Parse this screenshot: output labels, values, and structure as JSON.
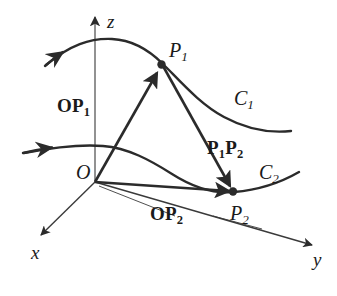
{
  "figure": {
    "background_color": "#ffffff",
    "stroke_color": "#2b2b2b",
    "text_color": "#1a1a1a"
  },
  "axes": [
    {
      "id": "z",
      "label": "z",
      "direction": "up",
      "tip": [
        95,
        14
      ],
      "origin": [
        95,
        182
      ]
    },
    {
      "id": "x",
      "label": "x",
      "direction": "down-left",
      "tip": [
        38,
        238
      ],
      "origin": [
        95,
        182
      ]
    },
    {
      "id": "y",
      "label": "y",
      "direction": "right-down",
      "tip": [
        316,
        246
      ],
      "origin": [
        95,
        182
      ]
    }
  ],
  "origin": {
    "label": "O",
    "point": [
      95,
      182
    ]
  },
  "points": [
    {
      "id": "P1",
      "label": "P",
      "subscript": "1",
      "coords": [
        161,
        64
      ]
    },
    {
      "id": "P2",
      "label": "P",
      "subscript": "2",
      "coords": [
        233,
        192
      ]
    }
  ],
  "curves": [
    {
      "id": "C1",
      "label": "C",
      "subscript": "1",
      "arrow": "start",
      "note": "upper space curve through P1"
    },
    {
      "id": "C2",
      "label": "C",
      "subscript": "2",
      "arrow": "start",
      "note": "lower space curve through P2"
    }
  ],
  "vectors": [
    {
      "id": "OP1",
      "label_bold": "OP",
      "subscript": "1",
      "from": "O",
      "to": "P1"
    },
    {
      "id": "OP2",
      "label_bold": "OP",
      "subscript": "2",
      "from": "O",
      "to": "P2"
    },
    {
      "id": "P1P2",
      "label_bold": "P",
      "subscript": "1",
      "label_bold2": "P",
      "subscript2": "2",
      "from": "P1",
      "to": "P2"
    }
  ],
  "labels": {
    "axis_z": "z",
    "axis_x": "x",
    "axis_y": "y",
    "origin": "O",
    "point_p1_base": "P",
    "point_p1_sub": "1",
    "point_p2_base": "P",
    "point_p2_sub": "2",
    "curve_c1_base": "C",
    "curve_c1_sub": "1",
    "curve_c2_base": "C",
    "curve_c2_sub": "2",
    "vector_op1_base": "OP",
    "vector_op1_sub": "1",
    "vector_op2_base": "OP",
    "vector_op2_sub": "2",
    "vector_p1p2_a": "P",
    "vector_p1p2_a_sub": "1",
    "vector_p1p2_b": "P",
    "vector_p1p2_b_sub": "2"
  }
}
